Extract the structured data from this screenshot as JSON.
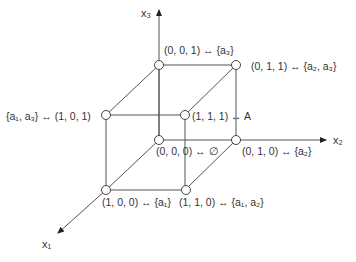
{
  "axes": {
    "x1": {
      "label": "x₁"
    },
    "x2": {
      "label": "x₂"
    },
    "x3": {
      "label": "x₃"
    }
  },
  "nodes": [
    {
      "id": "001",
      "label": "(0, 0, 1) ↔ {a₃}"
    },
    {
      "id": "011",
      "label": "(0, 1, 1) ↔ {a₂, a₃}"
    },
    {
      "id": "101",
      "label": "{a₁, a₃} ↔ (1, 0, 1)"
    },
    {
      "id": "111",
      "label": "(1, 1, 1) ↔ A"
    },
    {
      "id": "000",
      "label": "(0, 0, 0) ↔ ∅"
    },
    {
      "id": "010",
      "label": "(0, 1, 0) ↔ {a₂}"
    },
    {
      "id": "100",
      "label": "(1, 0, 0) ↔ {a₁}"
    },
    {
      "id": "110",
      "label": "(1, 1, 0) ↔ {a₁, a₂}"
    }
  ],
  "colors": {
    "line": "#555555",
    "node_fill": "#ffffff"
  }
}
